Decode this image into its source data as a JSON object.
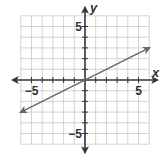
{
  "chart_data": {
    "type": "line",
    "title": "",
    "xlabel": "x",
    "ylabel": "y",
    "xlim": [
      -6,
      6
    ],
    "ylim": [
      -6,
      6
    ],
    "grid": true,
    "x_tick_labels": [
      {
        "value": -5,
        "label": "−5"
      },
      {
        "value": 5,
        "label": "5"
      }
    ],
    "y_tick_labels": [
      {
        "value": 5,
        "label": "5"
      },
      {
        "value": -5,
        "label": "−5"
      }
    ],
    "series": [
      {
        "name": "line",
        "equation": "y = 0.5x",
        "x": [
          -6,
          6
        ],
        "y": [
          -3,
          3
        ],
        "arrows": "both"
      }
    ],
    "colors": {
      "axis": "#333333",
      "grid": "#c8c8c8",
      "line": "#666666"
    }
  }
}
